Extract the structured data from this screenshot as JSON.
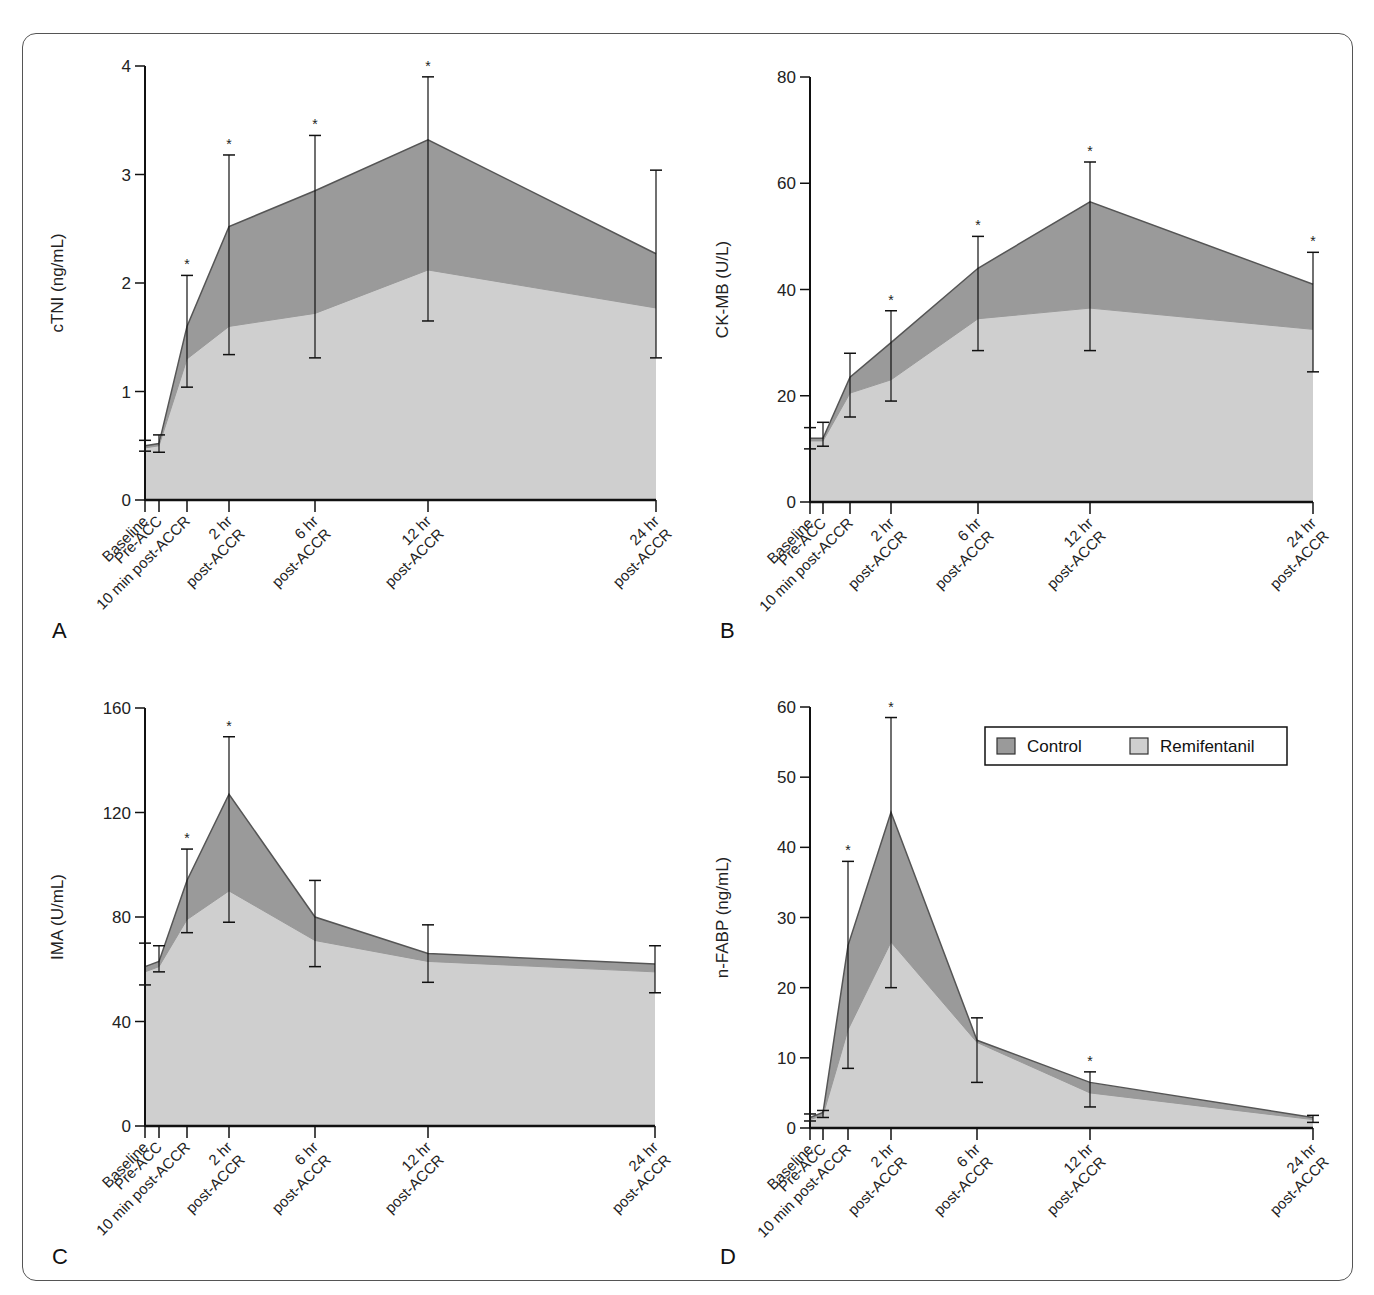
{
  "colors": {
    "control": "#9a9a9a",
    "remifentanil": "#cfcfcf",
    "line": "#555555",
    "axis": "#111111"
  },
  "legend": {
    "items": [
      {
        "label": "Control",
        "color": "#9a9a9a"
      },
      {
        "label": "Remifentanil",
        "color": "#cfcfcf"
      }
    ]
  },
  "categories": [
    "Baseline",
    "Pre-ACC",
    "10 min post-ACCR",
    "2 hr post-ACCR",
    "6 hr post-ACCR",
    "12 hr post-ACCR",
    "24 hr post-ACCR"
  ],
  "chart_data": [
    {
      "panel": "A",
      "type": "area",
      "ylabel": "cTNI (ng/mL)",
      "xlabel": "",
      "ylim": [
        0,
        4
      ],
      "yticks": [
        0,
        1,
        2,
        3,
        4
      ],
      "categories": [
        "Baseline",
        "Pre-ACC",
        "10 min post-ACCR",
        "2 hr post-ACCR",
        "6 hr post-ACCR",
        "12 hr post-ACCR",
        "24 hr post-ACCR"
      ],
      "series": [
        {
          "name": "Control",
          "values": [
            0.5,
            0.52,
            1.6,
            2.52,
            2.85,
            3.32,
            2.27
          ]
        },
        {
          "name": "Remifentanil",
          "values": [
            0.48,
            0.5,
            1.3,
            1.6,
            1.72,
            2.12,
            1.77
          ]
        }
      ],
      "error_bars": [
        [
          0.45,
          0.55
        ],
        [
          0.44,
          0.6
        ],
        [
          1.04,
          2.07
        ],
        [
          1.34,
          3.18
        ],
        [
          1.31,
          3.36
        ],
        [
          1.65,
          3.9
        ],
        [
          1.31,
          3.04
        ]
      ],
      "significant": [
        false,
        false,
        true,
        true,
        true,
        true,
        false
      ],
      "grid": false
    },
    {
      "panel": "B",
      "type": "area",
      "ylabel": "CK-MB (U/L)",
      "xlabel": "",
      "ylim": [
        0,
        80
      ],
      "yticks": [
        0,
        20,
        40,
        60,
        80
      ],
      "categories": [
        "Baseline",
        "Pre-ACC",
        "10 min post-ACCR",
        "2 hr post-ACCR",
        "6 hr post-ACCR",
        "12 hr post-ACCR",
        "24 hr post-ACCR"
      ],
      "series": [
        {
          "name": "Control",
          "values": [
            12,
            12,
            23.5,
            30,
            44,
            56.5,
            41
          ]
        },
        {
          "name": "Remifentanil",
          "values": [
            11.5,
            11.5,
            20.5,
            23,
            34.5,
            36.5,
            32.5
          ]
        }
      ],
      "error_bars": [
        [
          10,
          14
        ],
        [
          10.5,
          15
        ],
        [
          16,
          28
        ],
        [
          19,
          36
        ],
        [
          28.5,
          50
        ],
        [
          28.5,
          64
        ],
        [
          24.5,
          47
        ]
      ],
      "significant": [
        false,
        false,
        false,
        true,
        true,
        true,
        true
      ],
      "grid": false
    },
    {
      "panel": "C",
      "type": "area",
      "ylabel": "IMA (U/mL)",
      "xlabel": "",
      "ylim": [
        0,
        160
      ],
      "yticks": [
        0,
        40,
        80,
        120,
        160
      ],
      "categories": [
        "Baseline",
        "Pre-ACC",
        "10 min post-ACCR",
        "2 hr post-ACCR",
        "6 hr post-ACCR",
        "12 hr post-ACCR",
        "24 hr post-ACCR"
      ],
      "series": [
        {
          "name": "Control",
          "values": [
            61,
            63,
            94,
            127,
            80,
            66,
            62
          ]
        },
        {
          "name": "Remifentanil",
          "values": [
            59,
            61,
            79,
            90,
            71,
            63,
            59
          ]
        }
      ],
      "error_bars": [
        [
          54,
          70
        ],
        [
          59,
          69
        ],
        [
          74,
          106
        ],
        [
          78,
          149
        ],
        [
          61,
          94
        ],
        [
          55,
          77
        ],
        [
          51,
          69
        ]
      ],
      "significant": [
        false,
        false,
        true,
        true,
        false,
        false,
        false
      ],
      "grid": false
    },
    {
      "panel": "D",
      "type": "area",
      "ylabel": "n-FABP (ng/mL)",
      "xlabel": "",
      "ylim": [
        0,
        60
      ],
      "yticks": [
        0,
        10,
        20,
        30,
        40,
        50,
        60
      ],
      "categories": [
        "Baseline",
        "Pre-ACC",
        "10 min post-ACCR",
        "2 hr post-ACCR",
        "6 hr post-ACCR",
        "12 hr post-ACCR",
        "24 hr post-ACCR"
      ],
      "series": [
        {
          "name": "Control",
          "values": [
            1.5,
            2.2,
            26,
            45,
            12.5,
            6.5,
            1.5
          ]
        },
        {
          "name": "Remifentanil",
          "values": [
            1.2,
            1.8,
            14,
            26.5,
            12.2,
            5,
            1.2
          ]
        }
      ],
      "error_bars": [
        [
          1,
          2
        ],
        [
          1.5,
          2.5
        ],
        [
          8.5,
          38
        ],
        [
          20,
          58.5
        ],
        [
          6.5,
          15.7
        ],
        [
          3,
          8
        ],
        [
          0.8,
          1.8
        ]
      ],
      "significant": [
        false,
        false,
        true,
        true,
        false,
        true,
        false
      ],
      "grid": false,
      "legend_position": "upper right"
    }
  ],
  "layout": {
    "panels": [
      {
        "x0": 145,
        "y0": 500,
        "ytop": 66,
        "xs": [
          145,
          159,
          187,
          229,
          315,
          428,
          656
        ],
        "letter": {
          "x": 52,
          "y": 638
        }
      },
      {
        "x0": 810,
        "y0": 502,
        "ytop": 77,
        "xs": [
          810,
          823,
          850,
          891,
          978,
          1090,
          1313
        ],
        "letter": {
          "x": 720,
          "y": 638
        }
      },
      {
        "x0": 145,
        "y0": 1126,
        "ytop": 708,
        "xs": [
          145,
          159,
          187,
          229,
          315,
          428,
          655
        ],
        "letter": {
          "x": 52,
          "y": 1264
        }
      },
      {
        "x0": 810,
        "y0": 1128,
        "ytop": 707,
        "xs": [
          810,
          823,
          848,
          891,
          977,
          1090,
          1313
        ],
        "letter": {
          "x": 720,
          "y": 1264
        }
      }
    ]
  }
}
